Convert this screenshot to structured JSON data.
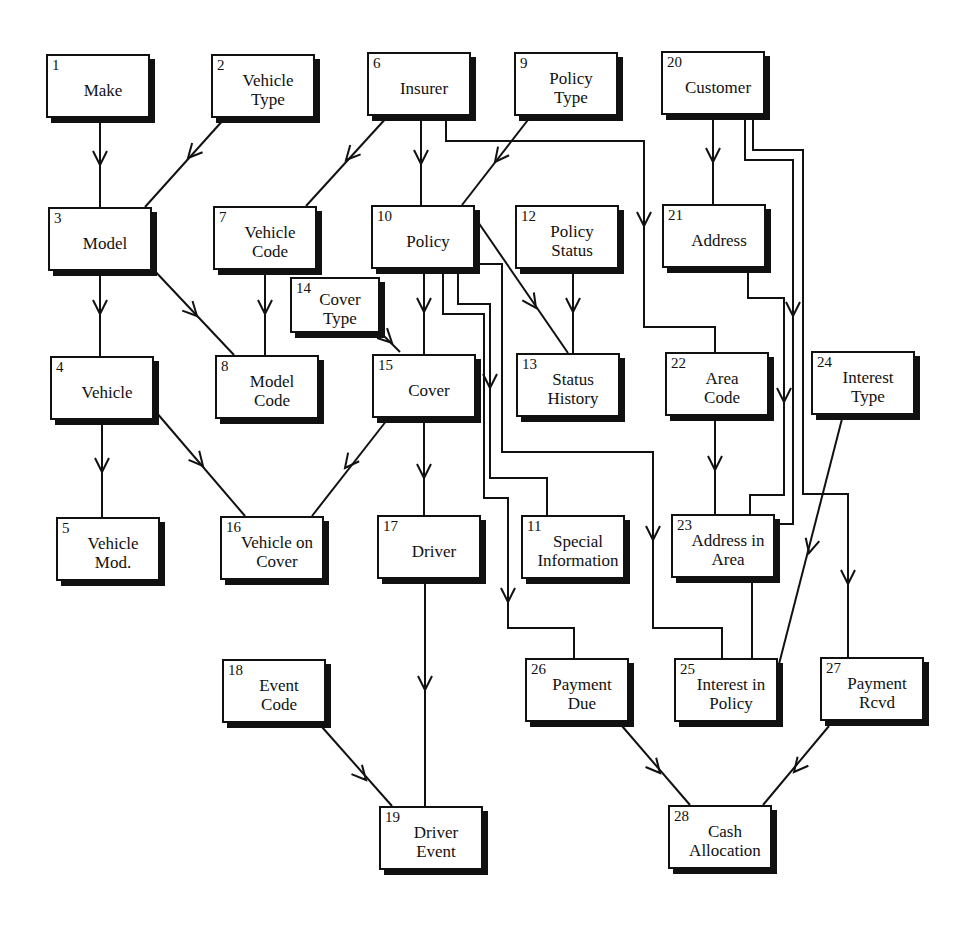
{
  "diagram": {
    "type": "entity-relationship",
    "entities": [
      {
        "id": "1",
        "label": "Make",
        "x": 46,
        "y": 54,
        "w": 104,
        "h": 64
      },
      {
        "id": "2",
        "label": "Vehicle\nType",
        "x": 211,
        "y": 54,
        "w": 104,
        "h": 64
      },
      {
        "id": "6",
        "label": "Insurer",
        "x": 367,
        "y": 52,
        "w": 104,
        "h": 64
      },
      {
        "id": "9",
        "label": "Policy\nType",
        "x": 514,
        "y": 52,
        "w": 104,
        "h": 64
      },
      {
        "id": "20",
        "label": "Customer",
        "x": 661,
        "y": 51,
        "w": 104,
        "h": 64
      },
      {
        "id": "3",
        "label": "Model",
        "x": 48,
        "y": 207,
        "w": 104,
        "h": 64
      },
      {
        "id": "7",
        "label": "Vehicle\nCode",
        "x": 213,
        "y": 206,
        "w": 104,
        "h": 64
      },
      {
        "id": "10",
        "label": "Policy",
        "x": 371,
        "y": 205,
        "w": 104,
        "h": 64
      },
      {
        "id": "12",
        "label": "Policy\nStatus",
        "x": 515,
        "y": 205,
        "w": 104,
        "h": 64
      },
      {
        "id": "21",
        "label": "Address",
        "x": 662,
        "y": 204,
        "w": 104,
        "h": 64
      },
      {
        "id": "14",
        "label": "Cover\nType",
        "x": 290,
        "y": 277,
        "w": 90,
        "h": 56
      },
      {
        "id": "4",
        "label": "Vehicle",
        "x": 50,
        "y": 356,
        "w": 104,
        "h": 64
      },
      {
        "id": "8",
        "label": "Model\nCode",
        "x": 215,
        "y": 355,
        "w": 104,
        "h": 64
      },
      {
        "id": "15",
        "label": "Cover",
        "x": 372,
        "y": 354,
        "w": 104,
        "h": 64
      },
      {
        "id": "13",
        "label": "Status\nHistory",
        "x": 516,
        "y": 353,
        "w": 104,
        "h": 64
      },
      {
        "id": "22",
        "label": "Area\nCode",
        "x": 665,
        "y": 352,
        "w": 104,
        "h": 64
      },
      {
        "id": "24",
        "label": "Interest\nType",
        "x": 811,
        "y": 351,
        "w": 104,
        "h": 64
      },
      {
        "id": "5",
        "label": "Vehicle\nMod.",
        "x": 56,
        "y": 517,
        "w": 104,
        "h": 64
      },
      {
        "id": "16",
        "label": "Vehicle on\nCover",
        "x": 220,
        "y": 516,
        "w": 104,
        "h": 64
      },
      {
        "id": "17",
        "label": "Driver",
        "x": 377,
        "y": 515,
        "w": 104,
        "h": 64
      },
      {
        "id": "11",
        "label": "Special\nInformation",
        "x": 521,
        "y": 515,
        "w": 104,
        "h": 64
      },
      {
        "id": "23",
        "label": "Address in\nArea",
        "x": 671,
        "y": 514,
        "w": 104,
        "h": 64
      },
      {
        "id": "18",
        "label": "Event\nCode",
        "x": 222,
        "y": 659,
        "w": 104,
        "h": 64
      },
      {
        "id": "26",
        "label": "Payment\nDue",
        "x": 525,
        "y": 658,
        "w": 104,
        "h": 64
      },
      {
        "id": "25",
        "label": "Interest in\nPolicy",
        "x": 674,
        "y": 658,
        "w": 104,
        "h": 64
      },
      {
        "id": "27",
        "label": "Payment\nRcvd",
        "x": 820,
        "y": 657,
        "w": 104,
        "h": 64
      },
      {
        "id": "19",
        "label": "Driver\nEvent",
        "x": 379,
        "y": 806,
        "w": 104,
        "h": 64
      },
      {
        "id": "28",
        "label": "Cash\nAllocation",
        "x": 668,
        "y": 805,
        "w": 104,
        "h": 64
      }
    ],
    "relationships": [
      {
        "from": "1",
        "to": "3",
        "points": [
          [
            100,
            118
          ],
          [
            100,
            207
          ]
        ],
        "arrow": [
          100,
          165
        ]
      },
      {
        "from": "2",
        "to": "3",
        "points": [
          [
            225,
            118
          ],
          [
            145,
            207
          ]
        ],
        "arrow": [
          188,
          158
        ]
      },
      {
        "from": "6",
        "to": "7",
        "points": [
          [
            388,
            116
          ],
          [
            306,
            206
          ]
        ],
        "arrow": [
          346,
          160
        ]
      },
      {
        "from": "6",
        "to": "10",
        "points": [
          [
            421,
            116
          ],
          [
            421,
            205
          ]
        ],
        "arrow": [
          421,
          164
        ]
      },
      {
        "from": "6",
        "to": "22",
        "points": [
          [
            446,
            116
          ],
          [
            446,
            141
          ],
          [
            644,
            141
          ],
          [
            644,
            327
          ],
          [
            715,
            327
          ],
          [
            715,
            352
          ]
        ],
        "arrow": [
          644,
          226
        ]
      },
      {
        "from": "9",
        "to": "10",
        "points": [
          [
            531,
            116
          ],
          [
            462,
            205
          ]
        ],
        "arrow": [
          495,
          162
        ]
      },
      {
        "from": "20",
        "to": "21",
        "points": [
          [
            713,
            115
          ],
          [
            713,
            204
          ]
        ],
        "arrow": [
          713,
          162
        ]
      },
      {
        "from": "20",
        "to": "25",
        "points": [
          [
            745,
            115
          ],
          [
            745,
            160
          ],
          [
            793,
            160
          ],
          [
            793,
            524
          ],
          [
            752,
            524
          ],
          [
            752,
            658
          ]
        ],
        "arrow": [
          793,
          316
        ]
      },
      {
        "from": "20",
        "to": "27",
        "points": [
          [
            753,
            115
          ],
          [
            753,
            150
          ],
          [
            803,
            150
          ],
          [
            803,
            494
          ],
          [
            848,
            494
          ],
          [
            848,
            657
          ]
        ],
        "arrow": [
          848,
          584
        ]
      },
      {
        "from": "3",
        "to": "4",
        "points": [
          [
            100,
            271
          ],
          [
            100,
            356
          ]
        ],
        "arrow": [
          100,
          314
        ]
      },
      {
        "from": "3",
        "to": "8",
        "points": [
          [
            152,
            268
          ],
          [
            234,
            355
          ]
        ],
        "arrow": [
          197,
          316
        ]
      },
      {
        "from": "7",
        "to": "8",
        "points": [
          [
            265,
            270
          ],
          [
            265,
            355
          ]
        ],
        "arrow": [
          265,
          314
        ]
      },
      {
        "from": "10",
        "to": "15",
        "points": [
          [
            424,
            269
          ],
          [
            424,
            354
          ]
        ],
        "arrow": [
          424,
          312
        ]
      },
      {
        "from": "10",
        "to": "13",
        "points": [
          [
            478,
            222
          ],
          [
            568,
            353
          ]
        ],
        "arrow": [
          536,
          308
        ]
      },
      {
        "from": "10",
        "to": "26",
        "points": [
          [
            443,
            269
          ],
          [
            443,
            314
          ],
          [
            484,
            314
          ],
          [
            484,
            498
          ],
          [
            508,
            498
          ],
          [
            508,
            628
          ],
          [
            574,
            628
          ],
          [
            574,
            658
          ]
        ],
        "arrow": [
          508,
          602
        ]
      },
      {
        "from": "10",
        "to": "11",
        "points": [
          [
            458,
            269
          ],
          [
            458,
            304
          ],
          [
            490,
            304
          ],
          [
            490,
            478
          ],
          [
            547,
            478
          ],
          [
            547,
            515
          ]
        ],
        "arrow": [
          490,
          388
        ]
      },
      {
        "from": "10",
        "to": "25",
        "points": [
          [
            475,
            264
          ],
          [
            502,
            264
          ],
          [
            502,
            452
          ],
          [
            653,
            452
          ],
          [
            653,
            628
          ],
          [
            722,
            628
          ],
          [
            722,
            658
          ]
        ],
        "arrow": [
          653,
          540
        ]
      },
      {
        "from": "12",
        "to": "13",
        "points": [
          [
            573,
            269
          ],
          [
            573,
            353
          ]
        ],
        "arrow": [
          573,
          312
        ]
      },
      {
        "from": "14",
        "to": "15",
        "points": [
          [
            378,
            330
          ],
          [
            400,
            352
          ]
        ],
        "arrow": [
          392,
          343
        ]
      },
      {
        "from": "21",
        "to": "23",
        "points": [
          [
            748,
            268
          ],
          [
            748,
            298
          ],
          [
            784,
            298
          ],
          [
            784,
            495
          ],
          [
            750,
            495
          ],
          [
            750,
            514
          ]
        ],
        "arrow": [
          784,
          402
        ]
      },
      {
        "from": "22",
        "to": "23",
        "points": [
          [
            715,
            416
          ],
          [
            715,
            514
          ]
        ],
        "arrow": [
          715,
          470
        ]
      },
      {
        "from": "24",
        "to": "25",
        "points": [
          [
            843,
            415
          ],
          [
            778,
            668
          ]
        ],
        "arrow": [
          809,
          553
        ]
      },
      {
        "from": "4",
        "to": "5",
        "points": [
          [
            102,
            420
          ],
          [
            102,
            517
          ]
        ],
        "arrow": [
          102,
          472
        ]
      },
      {
        "from": "4",
        "to": "16",
        "points": [
          [
            156,
            412
          ],
          [
            245,
            516
          ]
        ],
        "arrow": [
          203,
          466
        ]
      },
      {
        "from": "15",
        "to": "16",
        "points": [
          [
            387,
            420
          ],
          [
            312,
            516
          ]
        ],
        "arrow": [
          345,
          468
        ]
      },
      {
        "from": "15",
        "to": "17",
        "points": [
          [
            424,
            420
          ],
          [
            424,
            515
          ]
        ],
        "arrow": [
          424,
          478
        ]
      },
      {
        "from": "17",
        "to": "19",
        "points": [
          [
            425,
            579
          ],
          [
            425,
            806
          ]
        ],
        "arrow": [
          425,
          690
        ]
      },
      {
        "from": "18",
        "to": "19",
        "points": [
          [
            322,
            727
          ],
          [
            392,
            806
          ]
        ],
        "arrow": [
          366,
          780
        ]
      },
      {
        "from": "26",
        "to": "28",
        "points": [
          [
            622,
            726
          ],
          [
            690,
            805
          ]
        ],
        "arrow": [
          660,
          773
        ]
      },
      {
        "from": "27",
        "to": "28",
        "points": [
          [
            829,
            726
          ],
          [
            763,
            805
          ]
        ],
        "arrow": [
          794,
          772
        ]
      }
    ]
  },
  "colors": {
    "line": "#111111",
    "box_fill": "#ffffff",
    "shadow": "#111111",
    "background": "#ffffff"
  }
}
